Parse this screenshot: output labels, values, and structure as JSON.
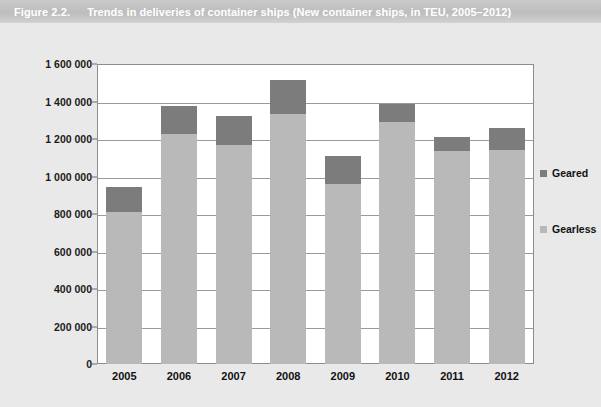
{
  "header": {
    "figure_number": "Figure 2.2.",
    "title": "Trends in deliveries of container ships (New container ships, in TEU, 2005–2012)"
  },
  "colors": {
    "band": "#bdbdbd",
    "page_background": "#e9e9e9",
    "plot_background": "#ffffff",
    "geared": "#7c7c7c",
    "gearless": "#b9b9b9",
    "gridline": "#9a9a9a"
  },
  "chart_data": {
    "type": "bar",
    "stacked": true,
    "title": "Trends in deliveries of container ships (New container ships, in TEU, 2005–2012)",
    "xlabel": "",
    "ylabel": "",
    "categories": [
      "2005",
      "2006",
      "2007",
      "2008",
      "2009",
      "2010",
      "2011",
      "2012"
    ],
    "series": [
      {
        "name": "Gearless",
        "color": "#b9b9b9",
        "values": [
          813000,
          1227000,
          1168000,
          1333000,
          960000,
          1291000,
          1136000,
          1141000
        ]
      },
      {
        "name": "Geared",
        "color": "#7c7c7c",
        "values": [
          133000,
          149000,
          155000,
          182000,
          149000,
          96000,
          75000,
          117000
        ]
      }
    ],
    "totals": [
      946000,
      1376000,
      1323000,
      1515000,
      1109000,
      1387000,
      1211000,
      1258000
    ],
    "ylim": [
      0,
      1600000
    ],
    "ytick_step": 200000,
    "ytick_labels": [
      "1 600 000",
      "1 400 000",
      "1 200 000",
      "1 000 000",
      "800 000",
      "600 000",
      "400 000",
      "200 000",
      "0"
    ],
    "ytick_values": [
      1600000,
      1400000,
      1200000,
      1000000,
      800000,
      600000,
      400000,
      200000,
      0
    ],
    "grid": true,
    "legend_position": "right",
    "legend": [
      {
        "label": "Geared",
        "color": "#7c7c7c"
      },
      {
        "label": "Gearless",
        "color": "#b9b9b9"
      }
    ]
  }
}
